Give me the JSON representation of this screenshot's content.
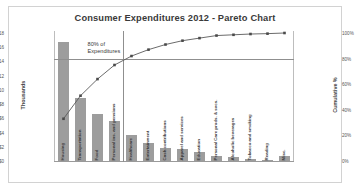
{
  "chart_data": {
    "type": "bar",
    "title": "Consumer Expenditures 2012 - Pareto Chart",
    "xlabel": "",
    "ylabel": "Thousands",
    "y2label": "Cumulative %",
    "ylim": [
      0,
      18
    ],
    "y2lim": [
      0,
      100
    ],
    "grid": false,
    "legend": "none",
    "categories": [
      "Housing",
      "Transportation",
      "Food",
      "Personal ins. and pensions",
      "Healthcare",
      "Entertainment",
      "Cash contributions",
      "Apparel and services",
      "Education",
      "Personal Care prods. & svcs.",
      "Alcoholic beverages",
      "Tobacco and smoking",
      "Reading",
      "Misc."
    ],
    "series": [
      {
        "name": "Expenditures",
        "type": "bar",
        "unit": "Thousands of dollars",
        "values": [
          16.8,
          8.9,
          6.6,
          5.6,
          3.6,
          2.6,
          1.9,
          1.7,
          1.2,
          0.7,
          0.5,
          0.35,
          0.12,
          0.75
        ]
      },
      {
        "name": "Cumulative %",
        "type": "line",
        "unit": "percent",
        "values": [
          33,
          51,
          64,
          75,
          82,
          87,
          91,
          94,
          96,
          98,
          98.6,
          99.2,
          99.5,
          100
        ]
      }
    ],
    "y_ticks": [
      "$0",
      "$2",
      "$4",
      "$6",
      "$8",
      "$10",
      "$12",
      "$14",
      "$16",
      "$18"
    ],
    "y_tick_values": [
      0,
      2,
      4,
      6,
      8,
      10,
      12,
      14,
      16,
      18
    ],
    "y2_ticks": [
      "0%",
      "20%",
      "40%",
      "60%",
      "80%",
      "100%"
    ],
    "y2_tick_values": [
      0,
      20,
      40,
      60,
      80,
      100
    ],
    "annotations": [
      {
        "text": "80% of Expenditures",
        "line1": "80% of",
        "line2": "Expenditures",
        "x_percent": 14,
        "y_percent": 8
      }
    ],
    "reference_lines": [
      {
        "name": "eighty-percent-horizontal",
        "axis": "y2",
        "value": 80
      },
      {
        "name": "eighty-percent-cutoff-vertical",
        "axis": "x",
        "after_category_index": 3
      }
    ],
    "colors": {
      "bar": "#9d9d9d",
      "line": "#5a5a5a",
      "marker": "#4a4a4a",
      "reference_line": "#8f8f8f",
      "border": "#d2d2d2",
      "axis": "#9a9a9a",
      "text": "#3a3a3a"
    }
  }
}
